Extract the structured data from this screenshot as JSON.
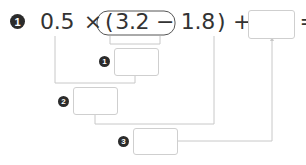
{
  "problem": {
    "number": "1",
    "equation": {
      "term_a": "0.5",
      "times": "×",
      "open_paren": "(",
      "inner_expression": "3.2 − 1.8",
      "close_paren": ")",
      "plus": "+",
      "term_b": "0.6",
      "equals": "="
    },
    "result_box": {
      "value": ""
    }
  },
  "steps": [
    {
      "number": "1",
      "value": ""
    },
    {
      "number": "2",
      "value": ""
    },
    {
      "number": "3",
      "value": ""
    }
  ],
  "colors": {
    "line": "#c8c8c8",
    "box_border": "#cfcfcf",
    "badge": "#2b2b2b",
    "text": "#333333"
  }
}
